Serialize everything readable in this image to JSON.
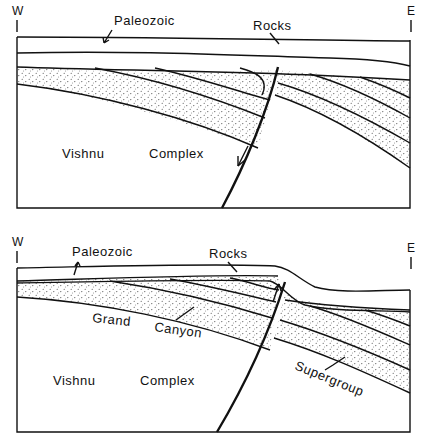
{
  "colors": {
    "ink": "#111111",
    "paper": "#ffffff",
    "stipple": "#444444"
  },
  "panels": [
    {
      "id": "before",
      "direction_west": "W",
      "direction_east": "E",
      "labels": {
        "paleozoic": "Paleozoic",
        "rocks": "Rocks",
        "vishnu": "Vishnu",
        "complex": "Complex"
      },
      "fault_motion": "down-arrow (normal)"
    },
    {
      "id": "after",
      "direction_west": "W",
      "direction_east": "E",
      "labels": {
        "paleozoic": "Paleozoic",
        "rocks": "Rocks",
        "grand": "Grand",
        "canyon": "Canyon",
        "supergroup": "Supergroup",
        "vishnu": "Vishnu",
        "complex": "Complex"
      },
      "fault_motion": "up-arrow (reverse)"
    }
  ]
}
